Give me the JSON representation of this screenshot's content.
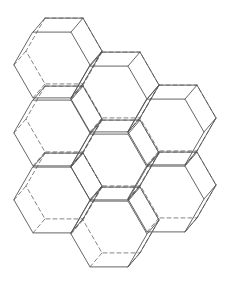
{
  "diagram": {
    "title": "",
    "hex_side": 38,
    "depth_offset": [
      12,
      -14
    ],
    "line_color": "#555555",
    "hidden_line_style": "dashed",
    "prisms": [
      {
        "col": 0,
        "cx": 52,
        "cy": 65
      },
      {
        "col": 0,
        "cx": 52,
        "cy": 133
      },
      {
        "col": 0,
        "cx": 52,
        "cy": 200
      },
      {
        "col": 1,
        "cx": 109,
        "cy": 99
      },
      {
        "col": 1,
        "cx": 109,
        "cy": 167
      },
      {
        "col": 1,
        "cx": 109,
        "cy": 234
      },
      {
        "col": 2,
        "cx": 166,
        "cy": 132
      },
      {
        "col": 2,
        "cx": 166,
        "cy": 199
      }
    ]
  }
}
